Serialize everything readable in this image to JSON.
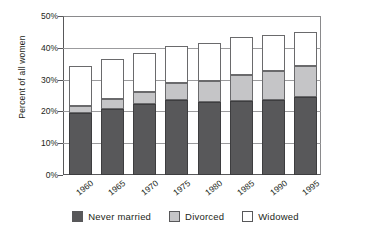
{
  "chart_data": {
    "type": "bar",
    "stacked": true,
    "title": "",
    "xlabel": "",
    "ylabel": "Percent of all women",
    "ylim": [
      0,
      50
    ],
    "ytick_labels": [
      "0%",
      "10%",
      "20%",
      "30%",
      "40%",
      "50%"
    ],
    "ytick_values": [
      0,
      10,
      20,
      30,
      40,
      50
    ],
    "grid": true,
    "legend_position": "bottom",
    "categories": [
      "1960",
      "1965",
      "1970",
      "1975",
      "1980",
      "1985",
      "1990",
      "1995"
    ],
    "series": [
      {
        "name": "Never married",
        "color": "#58585a",
        "values": [
          19.4,
          20.8,
          22.4,
          23.5,
          23.0,
          23.4,
          23.6,
          24.4
        ]
      },
      {
        "name": "Divorced",
        "color": "#c5c5c7",
        "values": [
          2.2,
          3.0,
          3.6,
          5.3,
          6.7,
          8.2,
          9.0,
          9.8
        ]
      },
      {
        "name": "Widowed",
        "color": "#ffffff",
        "values": [
          12.7,
          12.6,
          12.5,
          11.7,
          11.9,
          11.9,
          11.4,
          10.8
        ]
      }
    ],
    "totals": [
      34.3,
      36.4,
      38.5,
      40.5,
      41.6,
      43.5,
      44.0,
      45.0
    ]
  },
  "legend": {
    "items": [
      {
        "label": "Never married",
        "color": "#58585a"
      },
      {
        "label": "Divorced",
        "color": "#c5c5c7"
      },
      {
        "label": "Widowed",
        "color": "#ffffff"
      }
    ]
  },
  "colors": {
    "never_married": "#58585a",
    "divorced": "#c5c5c7",
    "widowed": "#ffffff",
    "axis": "#58585a",
    "grid": "#9b9b9d",
    "text": "#231f20"
  }
}
